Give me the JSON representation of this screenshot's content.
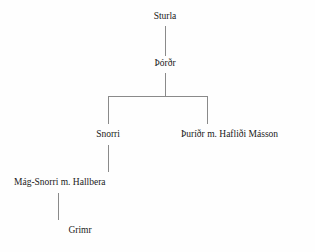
{
  "diagram": {
    "type": "genealogy-tree",
    "title": "",
    "background_color": "#fefefe",
    "line_color": "#8a8a8a",
    "text_color": "#1a1a1a",
    "nodes": [
      {
        "id": "sturla",
        "label": "Sturla",
        "generation": 1
      },
      {
        "id": "thordr",
        "label": "Þórðr",
        "generation": 2
      },
      {
        "id": "snorri",
        "label": "Snorri",
        "generation": 3
      },
      {
        "id": "thuridr",
        "label": "Þuríðr m. Hafliði Másson",
        "generation": 3
      },
      {
        "id": "magsnorri",
        "label": "Mág-Snorri m. Hallbera",
        "generation": 4
      },
      {
        "id": "grimr",
        "label": "Grimr",
        "generation": 5
      }
    ],
    "edges": [
      {
        "from": "sturla",
        "to": "thordr"
      },
      {
        "from": "thordr",
        "to": "snorri"
      },
      {
        "from": "thordr",
        "to": "thuridr"
      },
      {
        "from": "snorri",
        "to": "magsnorri"
      },
      {
        "from": "magsnorri",
        "to": "grimr"
      }
    ]
  }
}
